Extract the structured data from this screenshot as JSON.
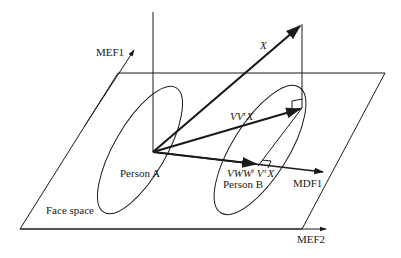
{
  "diagram": {
    "labels": {
      "mef1": "MEF1",
      "mef2": "MEF2",
      "mdf1": "MDF1",
      "x_vector": "X",
      "projection": "VV",
      "projection_sup": "t",
      "projection_end": "X",
      "mdf_projection": "VWW",
      "mdf_projection_sup1": "t",
      "mdf_projection_mid": " V",
      "mdf_projection_sup2": "t",
      "mdf_projection_end": "X",
      "person_a": "Person A",
      "person_b": "Person B",
      "face_space": "Face space"
    },
    "colors": {
      "stroke": "#1a1a1a",
      "background": "#ffffff"
    }
  }
}
